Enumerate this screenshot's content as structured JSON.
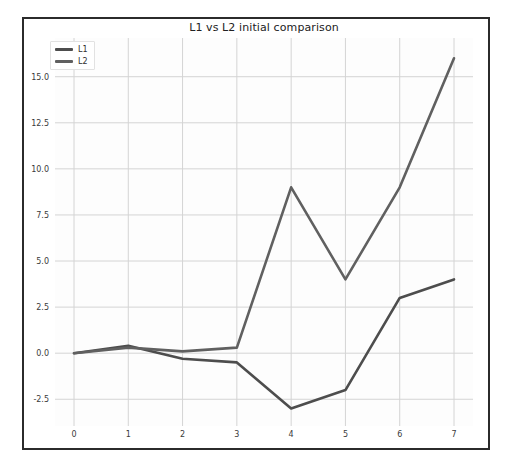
{
  "chart_data": {
    "type": "line",
    "title": "L1 vs L2 initial comparison",
    "xlabel": "",
    "ylabel": "",
    "x": [
      0,
      1,
      2,
      3,
      4,
      5,
      6,
      7
    ],
    "categories": [
      "0",
      "1",
      "2",
      "3",
      "4",
      "5",
      "6",
      "7"
    ],
    "series": [
      {
        "name": "L1",
        "color": "#4d4d4d",
        "values": [
          0.0,
          0.4,
          -0.3,
          -0.5,
          -3.0,
          -2.0,
          3.0,
          4.0
        ]
      },
      {
        "name": "L2",
        "color": "#606060",
        "values": [
          0.0,
          0.3,
          0.1,
          0.3,
          9.0,
          4.0,
          9.0,
          16.0
        ]
      }
    ],
    "xlim": [
      -0.35,
      7.35
    ],
    "ylim": [
      -3.95,
      17.1
    ],
    "xticks": [
      0,
      1,
      2,
      3,
      4,
      5,
      6,
      7
    ],
    "xtick_labels": [
      "0",
      "1",
      "2",
      "3",
      "4",
      "5",
      "6",
      "7"
    ],
    "yticks": [
      -2.5,
      0.0,
      2.5,
      5.0,
      7.5,
      10.0,
      12.5,
      15.0
    ],
    "ytick_labels": [
      "-2.5",
      "0.0",
      "2.5",
      "5.0",
      "7.5",
      "10.0",
      "12.5",
      "15.0"
    ],
    "grid": true,
    "grid_color": "#d4d4d4",
    "legend": {
      "position": "upper-left",
      "entries": [
        "L1",
        "L2"
      ]
    },
    "background_color": "#fdfdfd",
    "frame_color": "#2b2b2b"
  }
}
